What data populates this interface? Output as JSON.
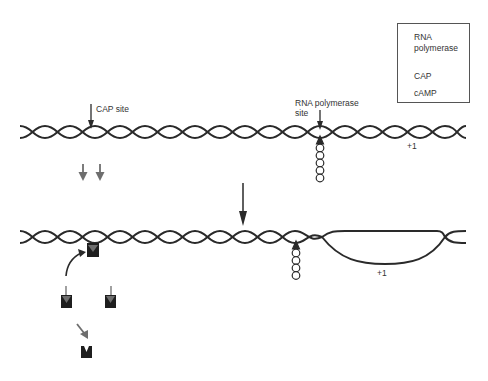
{
  "diagram": {
    "labels": {
      "cap_site": "CAP site",
      "rna_polymerase_site_line1": "RNA polymerase",
      "rna_polymerase_site_line2": "site",
      "plus_one_top": "+1",
      "plus_one_bottom": "+1"
    },
    "legend": {
      "items": [
        {
          "icon": "rna-polymerase-icon",
          "label_line1": "RNA",
          "label_line2": "polymerase"
        },
        {
          "icon": "cap-arrow-icon",
          "label": "CAP"
        },
        {
          "icon": "camp-icon",
          "label": "cAMP"
        }
      ]
    },
    "colors": {
      "dna_strand": "#2a2a2a",
      "cap_arrow": "#6e6e6e",
      "camp_block": "#1e1e1e",
      "text": "#333333",
      "legend_border": "#555555"
    },
    "panels": [
      {
        "name": "before",
        "description": "Free CAP; RNA polymerase bound at promoter, DNA closed"
      },
      {
        "name": "after",
        "description": "cAMP-CAP bound at CAP site; open complex (bubble) formed near +1"
      }
    ]
  }
}
